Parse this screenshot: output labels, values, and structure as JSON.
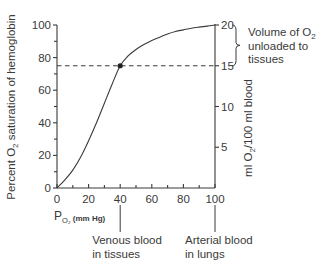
{
  "chart_data": {
    "type": "line",
    "title": "",
    "xlabel": "P",
    "xlabel_sub": "O₂",
    "xlabel_unit": "(mm Hg)",
    "ylabel_left": "Percent O₂ saturation of hemoglobin",
    "ylabel_left_parts": {
      "pre": "Percent O",
      "sub": "2",
      "post": " saturation of hemoglobin"
    },
    "ylabel_right_parts": {
      "pre": "ml O",
      "sub": "2",
      "post": "/100 ml blood"
    },
    "xlim": [
      0,
      100
    ],
    "ylim": [
      0,
      100
    ],
    "ylim_right": [
      0,
      20
    ],
    "x_ticks": [
      0,
      20,
      40,
      60,
      80,
      100
    ],
    "x_minor_ticks": [
      10,
      30,
      50,
      70,
      90
    ],
    "y_ticks": [
      0,
      20,
      40,
      60,
      80,
      100
    ],
    "y_minor_ticks": [
      10,
      30,
      50,
      70,
      90
    ],
    "y_right_ticks": [
      5,
      10,
      15,
      20
    ],
    "grid": false,
    "series": [
      {
        "name": "Hemoglobin O2 dissociation curve",
        "x": [
          0,
          5,
          10,
          15,
          20,
          25,
          30,
          35,
          40,
          45,
          50,
          55,
          60,
          65,
          70,
          75,
          80,
          85,
          90,
          95,
          100
        ],
        "y": [
          0,
          5,
          11,
          19,
          29,
          40,
          52,
          64,
          75,
          81,
          85,
          88,
          90.5,
          92.5,
          94.5,
          96,
          97,
          98,
          98.7,
          99.3,
          100
        ]
      }
    ],
    "marker_point": {
      "x": 40,
      "y": 75
    },
    "reference_line": {
      "y": 75,
      "style": "dashed",
      "right_value": 15
    },
    "annotations": {
      "brace_label_lines": [
        "Volume of O",
        "unloaded to",
        "tissues"
      ],
      "brace_label_sub": "2",
      "brace_range_right": [
        15,
        20
      ],
      "venous_lines": [
        "Venous blood",
        "in tissues"
      ],
      "venous_x": 40,
      "arterial_lines": [
        "Arterial blood",
        "in lungs"
      ],
      "arterial_x": 100
    }
  }
}
